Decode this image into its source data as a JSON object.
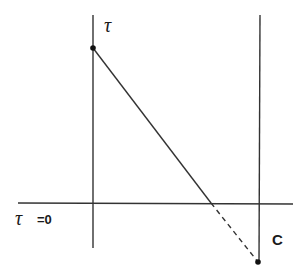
{
  "diagram": {
    "type": "geometric-sketch",
    "labels": {
      "top_point": "τ",
      "axis_label_symbol": "τ",
      "axis_label_eq": "=0",
      "right_line": "C"
    },
    "lines": {
      "left_vertical": {
        "x": 93,
        "y1": 15,
        "y2": 248
      },
      "right_vertical": {
        "x": 260,
        "y1": 15,
        "y2": 262
      },
      "horizontal_axis": {
        "y": 203,
        "x1": 18,
        "x2": 293
      },
      "diagonal_solid": {
        "x1": 93,
        "y1": 48,
        "x2": 211,
        "y2": 203
      },
      "diagonal_dashed": {
        "x1": 211,
        "y1": 203,
        "x2": 258,
        "y2": 262
      }
    },
    "points": [
      {
        "name": "top",
        "x": 93,
        "y": 48
      },
      {
        "name": "bottom",
        "x": 258,
        "y": 262
      }
    ],
    "colors": {
      "stroke": "#333333",
      "background": "#ffffff"
    }
  }
}
